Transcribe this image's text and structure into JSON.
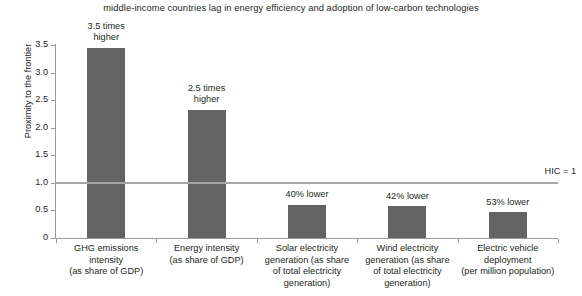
{
  "chart_data": {
    "type": "bar",
    "title": "middle-income countries lag in energy efficiency and adoption of low-carbon technologies",
    "xlabel": "",
    "ylabel": "Proximity to the frontier",
    "ylim": [
      0,
      3.5
    ],
    "grid": false,
    "legend": "none",
    "y_ticks": [
      "0",
      "0.5",
      "1.0",
      "1.5",
      "2.0",
      "2.5",
      "3.0",
      "3.5"
    ],
    "y_tick_values": [
      0,
      0.5,
      1.0,
      1.5,
      2.0,
      2.5,
      3.0,
      3.5
    ],
    "categories": [
      "GHG emissions intensity (as share of GDP)",
      "Energy intensity (as share of GDP)",
      "Solar electricity generation (as share of total electricity generation)",
      "Wind electricity generation (as share of total electricity generation)",
      "Electric vehicle deployment (per million population)"
    ],
    "category_lines": [
      [
        "GHG emissions",
        "intensity",
        "(as share of GDP)"
      ],
      [
        "Energy intensity",
        "(as share of GDP)"
      ],
      [
        "Solar electricity",
        "generation (as share",
        "of total electricity",
        "generation)"
      ],
      [
        "Wind electricity",
        "generation (as share",
        "of total electricity",
        "generation)"
      ],
      [
        "Electric vehicle",
        "deployment",
        "(per million population)"
      ]
    ],
    "values": [
      3.45,
      2.33,
      0.6,
      0.58,
      0.47
    ],
    "annotations": [
      [
        "3.5 times",
        "higher"
      ],
      [
        "2.5 times",
        "higher"
      ],
      [
        "40% lower"
      ],
      [
        "42% lower"
      ],
      [
        "53% lower"
      ]
    ],
    "reference_line": {
      "value": 1.0,
      "label": "HIC = 1"
    },
    "colors": {
      "bar": "#636363",
      "reference_line": "#a6a6a6",
      "axis": "#9a9a9a",
      "text": "#231f20",
      "background": "#ffffff"
    }
  }
}
